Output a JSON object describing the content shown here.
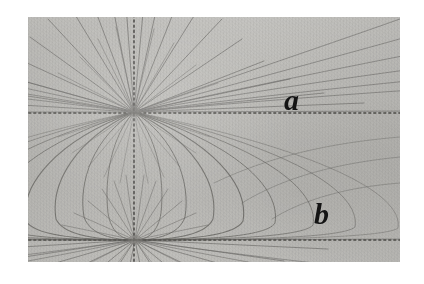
{
  "figure": {
    "caption_labels": [
      {
        "id": "a",
        "text": "a",
        "x": 256,
        "y": 68,
        "description": "open field line label in upper right region"
      },
      {
        "id": "b",
        "text": "b",
        "x": 286,
        "y": 182,
        "description": "closed loop label in lower right region"
      }
    ],
    "plate": {
      "left": 28,
      "top": 17,
      "width": 372,
      "height": 245,
      "base_color": "#bcbbb7",
      "border_color": "#a8a7a3",
      "margin_color": "#ffffff"
    },
    "colors": {
      "background": "#ffffff",
      "photo_base": "#bcbbb7",
      "field_line": "#6e6d6a",
      "dotted_line": "#5d5c59",
      "label_ink": "#141414"
    }
  },
  "chart_data": {
    "type": "scatter",
    "title": "",
    "subtitle": "",
    "xlabel": "",
    "ylabel": "",
    "grid": false,
    "legend": "none",
    "poles": [
      {
        "name": "upper-pole",
        "x": 106,
        "y": 95,
        "type": "focus",
        "spoke_count": 26
      },
      {
        "name": "lower-pole",
        "x": 107,
        "y": 223,
        "type": "focus",
        "spoke_count": 24
      }
    ],
    "axes_lines": [
      {
        "name": "vertical-dotted-axis",
        "orientation": "vertical",
        "x": 106,
        "y_start": 0,
        "y_end": 245,
        "style": "dotted"
      },
      {
        "name": "upper-horizontal-dotted-axis",
        "orientation": "horizontal",
        "y": 96,
        "x_start": 0,
        "x_end": 372,
        "style": "dotted"
      },
      {
        "name": "lower-horizontal-dotted-axis",
        "orientation": "horizontal",
        "y": 223,
        "x_start": 0,
        "x_end": 372,
        "style": "dotted"
      }
    ],
    "loops": [
      {
        "name": "loop-1",
        "width_half": 34,
        "label": ""
      },
      {
        "name": "loop-2",
        "width_half": 58,
        "label": ""
      },
      {
        "name": "loop-3",
        "width_half": 86,
        "label": ""
      },
      {
        "name": "loop-4",
        "width_half": 116,
        "label": "b"
      },
      {
        "name": "loop-5",
        "width_half": 150,
        "label": ""
      },
      {
        "name": "loop-6",
        "width_half": 188,
        "label": ""
      },
      {
        "name": "loop-7",
        "width_half": 232,
        "label": ""
      }
    ],
    "open_lines_label": "a",
    "open_lines_count": 26
  }
}
